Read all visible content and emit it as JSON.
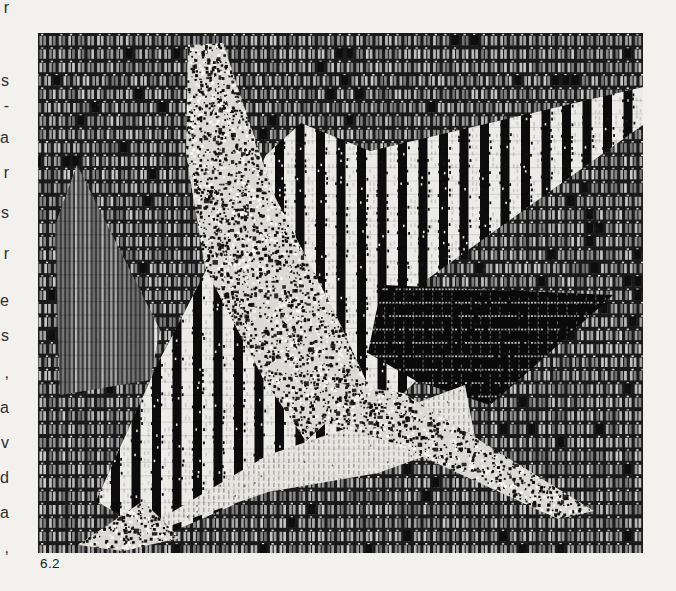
{
  "page": {
    "background_color": "#f2f1ee"
  },
  "caption": {
    "label": "6.2"
  },
  "margin_text_fragments": [
    {
      "y": 12,
      "char": "r"
    },
    {
      "y": 85,
      "char": "s"
    },
    {
      "y": 110,
      "char": "-"
    },
    {
      "y": 142,
      "char": "a"
    },
    {
      "y": 177,
      "char": "r"
    },
    {
      "y": 217,
      "char": "s"
    },
    {
      "y": 258,
      "char": "r"
    },
    {
      "y": 305,
      "char": "e"
    },
    {
      "y": 340,
      "char": "s"
    },
    {
      "y": 377,
      "char": ","
    },
    {
      "y": 412,
      "char": "a"
    },
    {
      "y": 447,
      "char": "v"
    },
    {
      "y": 482,
      "char": "d"
    },
    {
      "y": 517,
      "char": "a"
    },
    {
      "y": 552,
      "char": ","
    }
  ],
  "figure": {
    "x": 38,
    "y": 33,
    "width": 605,
    "height": 520,
    "palette": {
      "paper": "#f2f1ee",
      "ink_dark": "#0c0c0c",
      "bar_light": "#b5b5b5",
      "stripe_white": "#ecebe7",
      "speckle_base": "#dbd9d3"
    },
    "shapes": [
      {
        "name": "woven-cell-background",
        "texture": "cells",
        "polygon": null
      },
      {
        "name": "left-fine-striped-triangle",
        "texture": "fine-stripes",
        "polygon": [
          [
            39,
            132
          ],
          [
            122,
            297
          ],
          [
            112,
            347
          ],
          [
            22,
            362
          ],
          [
            17,
            192
          ]
        ]
      },
      {
        "name": "central-bold-striped-band",
        "texture": "bold-stripes",
        "polygon": [
          [
            58,
            468
          ],
          [
            120,
            330
          ],
          [
            228,
            122
          ],
          [
            263,
            90
          ],
          [
            332,
            118
          ],
          [
            605,
            54
          ],
          [
            605,
            92
          ],
          [
            388,
            247
          ],
          [
            397,
            300
          ],
          [
            378,
            348
          ],
          [
            296,
            428
          ],
          [
            200,
            470
          ],
          [
            120,
            505
          ]
        ]
      },
      {
        "name": "upper-star-point-speckle",
        "texture": "speckle",
        "polygon": [
          [
            150,
            12
          ],
          [
            185,
            10
          ],
          [
            235,
            160
          ],
          [
            298,
            282
          ],
          [
            330,
            352
          ],
          [
            268,
            408
          ],
          [
            225,
            345
          ],
          [
            167,
            235
          ],
          [
            148,
            120
          ]
        ]
      },
      {
        "name": "dark-grid-triangle",
        "texture": "dark-grid",
        "polygon": [
          [
            345,
            252
          ],
          [
            575,
            262
          ],
          [
            500,
            330
          ],
          [
            452,
            372
          ],
          [
            378,
            348
          ],
          [
            330,
            320
          ],
          [
            338,
            280
          ]
        ]
      },
      {
        "name": "lower-light-striped-triangle",
        "texture": "light-stripes",
        "polygon": [
          [
            82,
            510
          ],
          [
            230,
            422
          ],
          [
            330,
            388
          ],
          [
            427,
            352
          ],
          [
            437,
            405
          ],
          [
            340,
            440
          ],
          [
            230,
            459
          ]
        ]
      },
      {
        "name": "lower-right-star-point-speckle",
        "texture": "speckle",
        "polygon": [
          [
            298,
            350
          ],
          [
            365,
            360
          ],
          [
            556,
            478
          ],
          [
            520,
            486
          ],
          [
            350,
            408
          ],
          [
            284,
            390
          ]
        ]
      },
      {
        "name": "lower-left-star-point-speckle",
        "texture": "speckle",
        "polygon": [
          [
            40,
            512
          ],
          [
            105,
            468
          ],
          [
            142,
            505
          ],
          [
            85,
            518
          ]
        ]
      }
    ]
  }
}
